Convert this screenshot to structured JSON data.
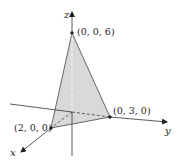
{
  "diagram": {
    "type": "3d-coordinate-plane-triangle",
    "axes": {
      "x": {
        "label": "x"
      },
      "y": {
        "label": "y"
      },
      "z": {
        "label": "z"
      }
    },
    "points": [
      {
        "id": "p-z",
        "label": "(0, 0, 6)"
      },
      {
        "id": "p-y",
        "label": "(0, 3, 0)"
      },
      {
        "id": "p-x",
        "label": "(2, 0, 0)"
      }
    ],
    "colors": {
      "fill": "#d9d9d9",
      "line": "#333333",
      "background": "#ffffff"
    }
  }
}
